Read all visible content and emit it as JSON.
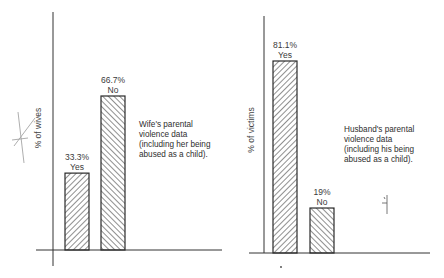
{
  "chart_data": [
    {
      "type": "bar",
      "title": "",
      "ylabel": "% of wives",
      "xlabel": "",
      "ylim": [
        0,
        100
      ],
      "categories": [
        "Yes",
        "No"
      ],
      "values": [
        33.3,
        66.7
      ],
      "value_labels": [
        "33.3%",
        "66.7%"
      ],
      "hatch": [
        "forward",
        "backward"
      ],
      "annotation": [
        "Wife's parental",
        "violence data",
        "(including her being",
        "abused as a child)."
      ],
      "grid": false
    },
    {
      "type": "bar",
      "title": "",
      "ylabel": "% of victims",
      "xlabel": "",
      "ylim": [
        0,
        100
      ],
      "categories": [
        "Yes",
        "No"
      ],
      "values": [
        81.1,
        19
      ],
      "value_labels": [
        "81.1%",
        "19%"
      ],
      "hatch": [
        "forward",
        "backward"
      ],
      "annotation": [
        "Husband's parental",
        "violence data",
        "(including his being",
        "abused as a child)."
      ],
      "grid": false
    }
  ]
}
